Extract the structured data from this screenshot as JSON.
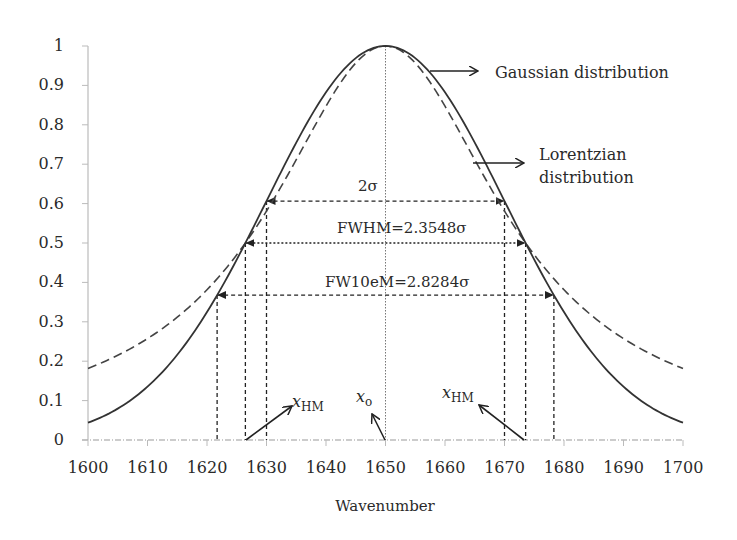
{
  "chart_data": {
    "type": "line",
    "title": "",
    "xlabel": "Wavenumber",
    "ylabel": "",
    "xlim": [
      1600,
      1700
    ],
    "ylim": [
      0,
      1
    ],
    "x_ticks": [
      1600,
      1610,
      1620,
      1630,
      1640,
      1650,
      1660,
      1670,
      1680,
      1690,
      1700
    ],
    "y_ticks": [
      0,
      0.1,
      0.2,
      0.3,
      0.4,
      0.5,
      0.6,
      0.7,
      0.8,
      0.9,
      1
    ],
    "y_tick_labels": [
      "0",
      "0.1",
      "0.2",
      "0.3",
      "0.4",
      "0.5",
      "0.6",
      "0.7",
      "0.8",
      "0.9",
      "1"
    ],
    "grid": false,
    "legend_position": "annotations",
    "center": 1650,
    "sigma": 20,
    "series": [
      {
        "name": "Gaussian distribution",
        "style": "solid",
        "formula": "exp(-(x-1650)^2/(2*20^2))",
        "x": [
          1600,
          1610,
          1620,
          1630,
          1640,
          1650,
          1660,
          1670,
          1680,
          1690,
          1700
        ],
        "values": [
          0.044,
          0.135,
          0.325,
          0.607,
          0.882,
          1.0,
          0.882,
          0.607,
          0.325,
          0.135,
          0.044
        ]
      },
      {
        "name": "Lorentzian distribution",
        "style": "dashed",
        "formula": "1/(1+((x-1650)/23.55)^2)",
        "x": [
          1600,
          1610,
          1620,
          1630,
          1640,
          1650,
          1660,
          1670,
          1680,
          1690,
          1700
        ],
        "values": [
          0.182,
          0.257,
          0.381,
          0.581,
          0.847,
          1.0,
          0.847,
          0.581,
          0.381,
          0.257,
          0.182
        ]
      }
    ],
    "annotations": [
      {
        "label": "2σ",
        "y": 0.6065,
        "x_left": 1630,
        "x_right": 1670
      },
      {
        "label": "FWHM=2.3548σ",
        "y": 0.5,
        "x_left": 1626.45,
        "x_right": 1673.55
      },
      {
        "label": "FW10eM=2.8284σ",
        "y": 0.3679,
        "x_left": 1621.7,
        "x_right": 1678.3
      },
      {
        "label": "xHM",
        "main": "x",
        "sub": "HM",
        "side": "left"
      },
      {
        "label": "xo",
        "main": "x",
        "sub": "o",
        "side": "center"
      },
      {
        "label": "xHM",
        "main": "x",
        "sub": "HM",
        "side": "right"
      }
    ],
    "legend": [
      "Gaussian distribution",
      "Lorentzian distribution"
    ]
  },
  "labels": {
    "gaussian": "Gaussian distribution",
    "lorentzian_1": "Lorentzian",
    "lorentzian_2": "distribution",
    "two_sigma": "2σ",
    "fwhm": "FWHM=2.3548σ",
    "fw10em": "FW10eM=2.8284σ",
    "x_main": "x",
    "sub_hm": "HM",
    "sub_o": "o",
    "xlabel": "Wavenumber"
  }
}
